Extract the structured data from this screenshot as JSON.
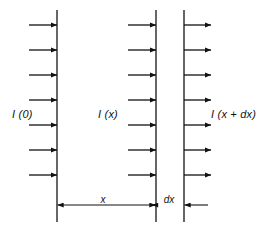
{
  "figure": {
    "kind": "physics-attenuation-diagram",
    "background_color": "#ffffff",
    "line_color": "#262626",
    "arrow_color": "#111111",
    "width": 275,
    "height": 238
  },
  "labels": {
    "incident": "I (0)",
    "at_x": "I (x)",
    "at_x_plus_dx": "I (x + dx)"
  },
  "dimensions": {
    "x_label": "x",
    "dx_label": "dx"
  },
  "boundaries": [
    {
      "name": "slab-front-face",
      "x": 57,
      "y_top": 10,
      "y_bottom": 222
    },
    {
      "name": "slab-inner-face",
      "x": 156,
      "y_top": 10,
      "y_bottom": 222
    },
    {
      "name": "slab-back-face",
      "x": 184,
      "y_top": 10,
      "y_bottom": 222
    }
  ],
  "ray_groups": [
    {
      "name": "incident-rays",
      "count": 7,
      "x_start": 29,
      "x_end": 57,
      "y_values": [
        25,
        50,
        75,
        100,
        125,
        150,
        175
      ]
    },
    {
      "name": "transmitted-rays-at-x",
      "count": 7,
      "x_start": 128,
      "x_end": 156,
      "y_values": [
        25,
        50,
        75,
        100,
        125,
        150,
        175
      ]
    },
    {
      "name": "transmitted-rays-at-x-plus-dx",
      "count": 7,
      "x_start": 184,
      "x_end": 211,
      "y_values": [
        25,
        50,
        75,
        100,
        125,
        150,
        175
      ]
    }
  ],
  "dimension_lines": [
    {
      "name": "x-dimension",
      "y": 205,
      "x_start": 57,
      "x_end": 156,
      "arrows": "both",
      "label_x": 107,
      "label_y": 203
    },
    {
      "name": "dx-dimension",
      "y": 205,
      "x_start": 184,
      "x_end": 208,
      "arrows": "left",
      "label_x": 170,
      "label_y": 203
    }
  ],
  "label_positions": {
    "incident": {
      "x": 12,
      "y": 118
    },
    "at_x": {
      "x": 98,
      "y": 118
    },
    "at_x_plus_dx": {
      "x": 211,
      "y": 118
    }
  }
}
